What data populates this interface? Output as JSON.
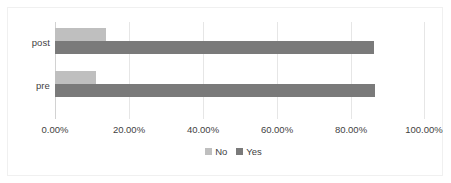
{
  "chart_data": {
    "type": "bar",
    "orientation": "horizontal",
    "title": "",
    "xlabel": "",
    "ylabel": "",
    "categories": [
      "post",
      "pre"
    ],
    "series": [
      {
        "name": "No",
        "color": "#bfbfbf",
        "values": [
          13.8,
          11.0
        ]
      },
      {
        "name": "Yes",
        "color": "#7a7a7a",
        "values": [
          86.2,
          86.5
        ]
      }
    ],
    "xlim": [
      0,
      100
    ],
    "xticks": [
      0,
      20,
      40,
      60,
      80,
      100
    ],
    "xtick_labels": [
      "0.00%",
      "20.00%",
      "40.00%",
      "60.00%",
      "80.00%",
      "100.00%"
    ],
    "grid": true,
    "legend_position": "bottom"
  },
  "axis": {
    "categories": [
      {
        "label": "post"
      },
      {
        "label": "pre"
      }
    ],
    "ticks": [
      {
        "label": "0.00%",
        "value": 0
      },
      {
        "label": "20.00%",
        "value": 20
      },
      {
        "label": "40.00%",
        "value": 40
      },
      {
        "label": "60.00%",
        "value": 60
      },
      {
        "label": "80.00%",
        "value": 80
      },
      {
        "label": "100.00%",
        "value": 100
      }
    ]
  },
  "legend": {
    "items": [
      {
        "label": "No",
        "color": "#bfbfbf"
      },
      {
        "label": "Yes",
        "color": "#7a7a7a"
      }
    ]
  }
}
